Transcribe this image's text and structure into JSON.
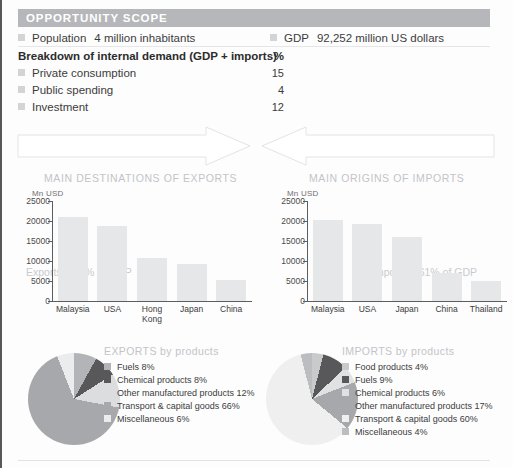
{
  "header": {
    "title": "OPPORTUNITY SCOPE",
    "bar_color": "#b6b7ba"
  },
  "scope": {
    "population": {
      "label": "Population",
      "value": "4 million inhabitants"
    },
    "gdp": {
      "label": "GDP",
      "value": "92,252 million US dollars"
    },
    "breakdown": {
      "title": "Breakdown of internal demand (GDP + imports)",
      "unit_header": "%",
      "rows": [
        {
          "label": "Private consumption",
          "value": "15"
        },
        {
          "label": "Public spending",
          "value": "4"
        },
        {
          "label": "Investment",
          "value": "12"
        }
      ]
    }
  },
  "flows": {
    "exports_arrow": "Exports: 180% of GDP",
    "imports_arrow": "Imports: 161% of GDP"
  },
  "charts": {
    "exports_title": "MAIN DESTINATIONS OF EXPORTS",
    "imports_title": "MAIN ORIGINS OF IMPORTS"
  },
  "chart_data": [
    {
      "type": "bar",
      "name": "main-destinations-of-exports",
      "title": "MAIN DESTINATIONS OF EXPORTS",
      "xlabel": "",
      "ylabel": "Mn USD",
      "ylim": [
        0,
        25000
      ],
      "yticks": [
        25000,
        20000,
        15000,
        10000,
        5000,
        0
      ],
      "ytick_labels": [
        "25000",
        "20000",
        "15000",
        "10000",
        "5000",
        "0"
      ],
      "grid": false,
      "legend": "none",
      "bar_color": "#e6e7e8",
      "categories": [
        "Malaysia",
        "USA",
        "Hong Kong",
        "Japan",
        "China"
      ],
      "values": [
        21000,
        18800,
        10700,
        9300,
        5300
      ]
    },
    {
      "type": "bar",
      "name": "main-origins-of-imports",
      "title": "MAIN ORIGINS OF IMPORTS",
      "xlabel": "",
      "ylabel": "Mn USD",
      "ylim": [
        0,
        25000
      ],
      "yticks": [
        25000,
        20000,
        15000,
        10000,
        5000,
        0
      ],
      "ytick_labels": [
        "25000",
        "20000",
        "15000",
        "10000",
        "5000",
        "0"
      ],
      "grid": false,
      "legend": "none",
      "bar_color": "#e6e7e8",
      "categories": [
        "Malaysia",
        "USA",
        "Japan",
        "China",
        "Thailand"
      ],
      "values": [
        20200,
        19200,
        16100,
        7100,
        5100
      ]
    },
    {
      "type": "pie",
      "name": "exports-by-products",
      "title": "EXPORTS by products",
      "legend": "right",
      "labels": [
        "Fuels 8%",
        "Chemical products 8%",
        "Other manufactured products 12%",
        "Transport & capital goods 66%",
        "Miscellaneous 6%"
      ],
      "values": [
        8,
        8,
        12,
        66,
        6
      ],
      "colors": [
        "#b3b4b7",
        "#58585a",
        "#dcdddf",
        "#a7a8ab",
        "#ebecee"
      ]
    },
    {
      "type": "pie",
      "name": "imports-by-products",
      "title": "IMPORTS by products",
      "legend": "right",
      "labels": [
        "Food products 4%",
        "Fuels 9%",
        "Chemical products 6%",
        "Other manufactured products 17%",
        "Transport & capital goods 60%",
        "Miscellaneous 4%"
      ],
      "values": [
        4,
        9,
        6,
        17,
        60,
        4
      ],
      "colors": [
        "#c9cacc",
        "#58585a",
        "#e0e1e3",
        "#a7a8ab",
        "#efeff0",
        "#bcbdc0"
      ]
    }
  ]
}
